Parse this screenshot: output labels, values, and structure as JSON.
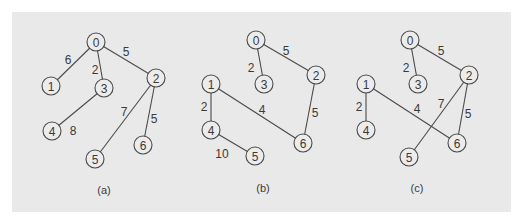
{
  "figure": {
    "background": "#e9e9e9",
    "stroke_color": "#4a4a4a",
    "node_radius": 9,
    "graphs": [
      {
        "id": "a",
        "caption": "(a)",
        "caption_pos": [
          104,
          190
        ],
        "nodes": [
          {
            "label": "0",
            "x": 96,
            "y": 42
          },
          {
            "label": "1",
            "x": 51,
            "y": 86
          },
          {
            "label": "2",
            "x": 156,
            "y": 78
          },
          {
            "label": "3",
            "x": 104,
            "y": 88
          },
          {
            "label": "4",
            "x": 52,
            "y": 131
          },
          {
            "label": "5",
            "x": 95,
            "y": 159
          },
          {
            "label": "6",
            "x": 143,
            "y": 145
          }
        ],
        "edges": [
          {
            "from": "0",
            "to": "1",
            "weight": "6",
            "label_pos": [
              68,
              60
            ]
          },
          {
            "from": "0",
            "to": "3",
            "weight": "2",
            "label_pos": [
              95,
              70
            ]
          },
          {
            "from": "0",
            "to": "2",
            "weight": "5",
            "label_pos": [
              126,
              52
            ]
          },
          {
            "from": "3",
            "to": "4",
            "weight": "8",
            "label_pos": [
              73,
              131
            ]
          },
          {
            "from": "2",
            "to": "5",
            "weight": "7",
            "label_pos": [
              124,
              112
            ]
          },
          {
            "from": "2",
            "to": "6",
            "weight": "5",
            "label_pos": [
              154,
              119
            ]
          }
        ]
      },
      {
        "id": "b",
        "caption": "(b)",
        "caption_pos": [
          263,
          188
        ],
        "nodes": [
          {
            "label": "0",
            "x": 256,
            "y": 40
          },
          {
            "label": "1",
            "x": 211,
            "y": 84
          },
          {
            "label": "2",
            "x": 316,
            "y": 75
          },
          {
            "label": "3",
            "x": 264,
            "y": 84
          },
          {
            "label": "4",
            "x": 211,
            "y": 130
          },
          {
            "label": "5",
            "x": 255,
            "y": 156
          },
          {
            "label": "6",
            "x": 303,
            "y": 143
          }
        ],
        "edges": [
          {
            "from": "0",
            "to": "3",
            "weight": "2",
            "label_pos": [
              251,
              68
            ]
          },
          {
            "from": "0",
            "to": "2",
            "weight": "5",
            "label_pos": [
              286,
              51
            ]
          },
          {
            "from": "1",
            "to": "4",
            "weight": "2",
            "label_pos": [
              204,
              107
            ]
          },
          {
            "from": "1",
            "to": "6",
            "weight": "4",
            "label_pos": [
              262,
              110
            ]
          },
          {
            "from": "2",
            "to": "6",
            "weight": "5",
            "label_pos": [
              315,
              113
            ]
          },
          {
            "from": "4",
            "to": "5",
            "weight": "10",
            "label_pos": [
              222,
              154
            ]
          }
        ]
      },
      {
        "id": "c",
        "caption": "(c)",
        "caption_pos": [
          417,
          188
        ],
        "nodes": [
          {
            "label": "0",
            "x": 410,
            "y": 40
          },
          {
            "label": "1",
            "x": 366,
            "y": 84
          },
          {
            "label": "2",
            "x": 469,
            "y": 75
          },
          {
            "label": "3",
            "x": 418,
            "y": 84
          },
          {
            "label": "4",
            "x": 366,
            "y": 130
          },
          {
            "label": "5",
            "x": 409,
            "y": 157
          },
          {
            "label": "6",
            "x": 457,
            "y": 143
          }
        ],
        "edges": [
          {
            "from": "0",
            "to": "3",
            "weight": "2",
            "label_pos": [
              406,
              68
            ]
          },
          {
            "from": "0",
            "to": "2",
            "weight": "5",
            "label_pos": [
              441,
              51
            ]
          },
          {
            "from": "1",
            "to": "4",
            "weight": "2",
            "label_pos": [
              359,
              107
            ]
          },
          {
            "from": "1",
            "to": "6",
            "weight": "4",
            "label_pos": [
              417,
              109
            ]
          },
          {
            "from": "2",
            "to": "5",
            "weight": "7",
            "label_pos": [
              441,
              104
            ]
          },
          {
            "from": "2",
            "to": "6",
            "weight": "5",
            "label_pos": [
              468,
              114
            ]
          }
        ]
      }
    ]
  }
}
